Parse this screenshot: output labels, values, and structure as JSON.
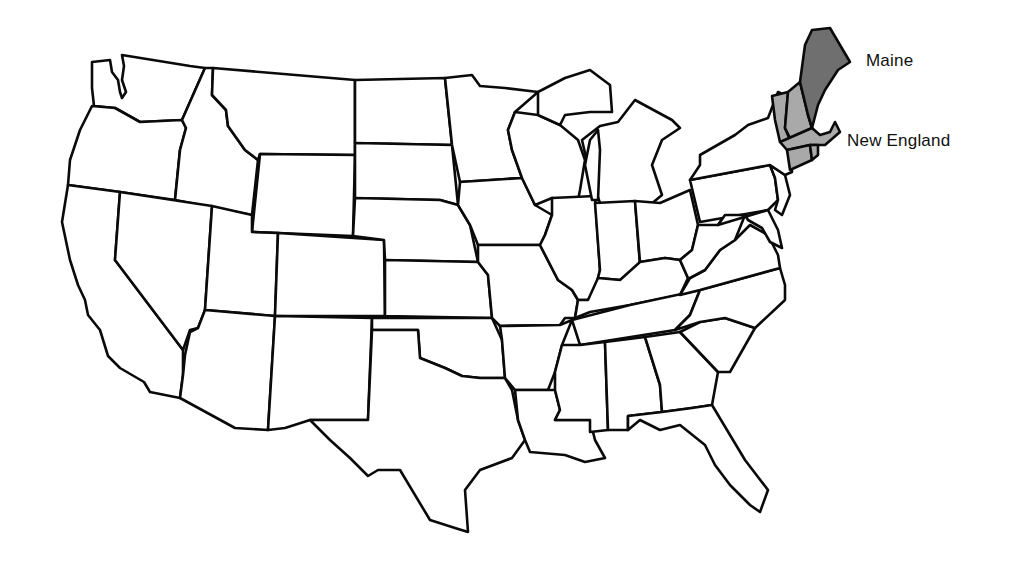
{
  "map": {
    "type": "outline map of the contiguous United States",
    "labels": [
      {
        "id": "maine",
        "text": "Maine"
      },
      {
        "id": "new_england",
        "text": "New England"
      }
    ],
    "highlighted": {
      "maine": {
        "fill": "#6f6f6f"
      },
      "new_england": {
        "states": [
          "Vermont",
          "New Hampshire",
          "Massachusetts",
          "Connecticut",
          "Rhode Island"
        ],
        "fill": "#a9a9a9"
      }
    },
    "colors": {
      "outline": "#0a0a0a",
      "background": "#ffffff"
    }
  }
}
